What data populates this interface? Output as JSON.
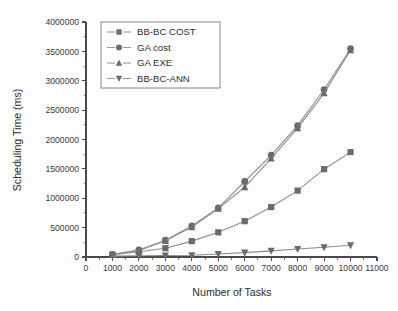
{
  "chart_data": {
    "type": "line",
    "title": "",
    "xlabel": "Number of Tasks",
    "ylabel": "Scheduling Time (ms)",
    "x": [
      1000,
      2000,
      3000,
      4000,
      5000,
      6000,
      7000,
      8000,
      9000,
      10000
    ],
    "xlim": [
      0,
      11000
    ],
    "ylim": [
      0,
      4000000
    ],
    "xticks": [
      0,
      1000,
      2000,
      3000,
      4000,
      5000,
      6000,
      7000,
      8000,
      9000,
      10000,
      11000
    ],
    "yticks": [
      0,
      500000,
      1000000,
      1500000,
      2000000,
      2500000,
      3000000,
      3500000,
      4000000
    ],
    "xtick_labels": [
      "0",
      "1000",
      "2000",
      "3000",
      "4000",
      "5000",
      "6000",
      "7000",
      "8000",
      "9000",
      "10000",
      "11000"
    ],
    "ytick_labels": [
      "0",
      "500000",
      "1000000",
      "1500000",
      "2000000",
      "2500000",
      "3000000",
      "3500000",
      "4000000"
    ],
    "grid": false,
    "legend_position": "top-left",
    "series": [
      {
        "name": "BB-BC COST",
        "marker": "square",
        "color": "#9a9a9a",
        "values": [
          40000,
          90000,
          150000,
          270000,
          420000,
          610000,
          850000,
          1130000,
          1495000,
          1785000
        ]
      },
      {
        "name": "GA cost",
        "marker": "circle",
        "color": "#6b6b6b",
        "values": [
          45000,
          120000,
          285000,
          530000,
          835000,
          1285000,
          1735000,
          2235000,
          2850000,
          3545000
        ]
      },
      {
        "name": "GA EXE",
        "marker": "triangle-up",
        "color": "#6b6b6b",
        "values": [
          42000,
          110000,
          275000,
          510000,
          825000,
          1190000,
          1680000,
          2195000,
          2790000,
          3520000
        ]
      },
      {
        "name": "BB-BC-ANN",
        "marker": "triangle-down",
        "color": "#8d8d8d",
        "values": [
          15000,
          20000,
          25000,
          30000,
          50000,
          75000,
          105000,
          135000,
          165000,
          200000
        ]
      }
    ]
  },
  "legend": {
    "entries": [
      {
        "label": "BB-BC COST"
      },
      {
        "label": "GA cost"
      },
      {
        "label": "GA EXE"
      },
      {
        "label": "BB-BC-ANN"
      }
    ]
  },
  "axes": {
    "x_title": "Number of Tasks",
    "y_title": "Scheduling Time (ms)"
  }
}
